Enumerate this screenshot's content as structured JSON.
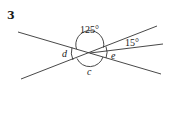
{
  "problem": {
    "number": "3"
  },
  "diagram": {
    "stroke_color": "#333333",
    "labels": {
      "angle_top": "125°",
      "angle_small": "15°",
      "angle_left": "d",
      "angle_right": "e",
      "angle_bottom": "c"
    }
  }
}
